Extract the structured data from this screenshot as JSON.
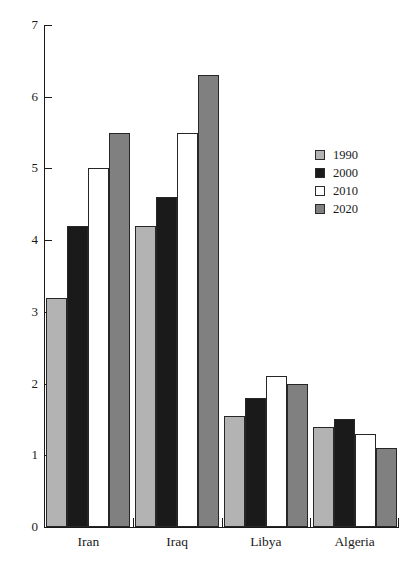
{
  "chart_data": {
    "type": "bar",
    "title": "",
    "subtitle": "",
    "xlabel": "",
    "ylabel": "",
    "categories": [
      "Iran",
      "Iraq",
      "Libya",
      "Algeria"
    ],
    "series": [
      {
        "name": "1990",
        "color": "#b3b3b3",
        "values": [
          3.2,
          4.2,
          1.55,
          1.4
        ]
      },
      {
        "name": "2000",
        "color": "#1a1a1a",
        "values": [
          4.2,
          4.6,
          1.8,
          1.5
        ]
      },
      {
        "name": "2010",
        "color": "#ffffff",
        "values": [
          5.0,
          5.5,
          2.1,
          1.3
        ]
      },
      {
        "name": "2020",
        "color": "#808080",
        "values": [
          5.5,
          6.3,
          2.0,
          1.1
        ]
      }
    ],
    "ylim": [
      0,
      7
    ],
    "y_ticks": [
      0,
      1,
      2,
      3,
      4,
      5,
      6,
      7
    ],
    "y_tick_labels": [
      "0",
      "1",
      "2",
      "3",
      "4",
      "5",
      "6",
      "7"
    ],
    "grid": false,
    "legend_position": "right",
    "legend_entries": [
      "1990",
      "2000",
      "2010",
      "2020"
    ],
    "annotations": []
  }
}
